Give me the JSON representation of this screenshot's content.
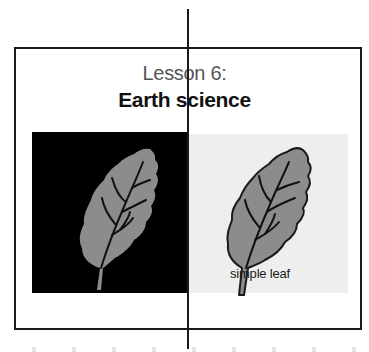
{
  "document": {
    "title_line1": "Lesson 6:",
    "title_line2": "Earth science"
  },
  "figure": {
    "left_panel": {
      "background": "#000000",
      "leaf_fill": "#8c8c8c",
      "vein_color": "#111111",
      "icon": "leaf-icon"
    },
    "right_panel": {
      "background": "#eeeeee",
      "leaf_fill": "#8c8c8c",
      "outline_color": "#1a1a1a",
      "icon": "leaf-icon",
      "label": "simple leaf"
    }
  },
  "colors": {
    "frame_border": "#1a1a1a",
    "cut_line": "#1a1a1a",
    "page_background": "#ffffff"
  }
}
